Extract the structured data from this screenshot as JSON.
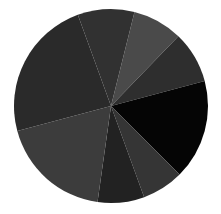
{
  "chart_data": {
    "type": "pie",
    "title": "",
    "legend": [],
    "labels_visible": false,
    "start_angle_deg": 14,
    "direction": "clockwise",
    "center": [
      111,
      106
    ],
    "radius": 97,
    "slices": [
      {
        "label": "",
        "degrees": 30,
        "value_pct": 8.3,
        "color": "#4a4a4a"
      },
      {
        "label": "",
        "degrees": 31,
        "value_pct": 8.6,
        "color": "#2e2e2e"
      },
      {
        "label": "",
        "degrees": 60,
        "value_pct": 16.7,
        "color": "#050505"
      },
      {
        "label": "",
        "degrees": 25,
        "value_pct": 6.9,
        "color": "#353535"
      },
      {
        "label": "",
        "degrees": 28,
        "value_pct": 7.8,
        "color": "#222222"
      },
      {
        "label": "",
        "degrees": 67,
        "value_pct": 18.6,
        "color": "#3c3c3c"
      },
      {
        "label": "",
        "degrees": 85,
        "value_pct": 23.6,
        "color": "#2a2a2a"
      },
      {
        "label": "",
        "degrees": 34,
        "value_pct": 9.4,
        "color": "#313131"
      }
    ]
  }
}
